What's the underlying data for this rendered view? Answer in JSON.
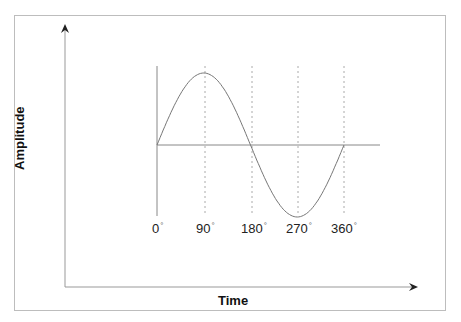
{
  "diagram": {
    "x_axis_label": "Time",
    "y_axis_label": "Amplitude",
    "tick_labels": [
      {
        "value": "0",
        "unit": "°",
        "x": 152
      },
      {
        "value": "90",
        "unit": "°",
        "x": 196
      },
      {
        "value": "180",
        "unit": "°",
        "x": 241
      },
      {
        "value": "270",
        "unit": "°",
        "x": 286
      },
      {
        "value": "360",
        "unit": "°",
        "x": 331
      }
    ]
  },
  "chart_data": {
    "type": "line",
    "title": "",
    "xlabel": "Time",
    "ylabel": "Amplitude",
    "categories": [
      "0°",
      "90°",
      "180°",
      "270°",
      "360°"
    ],
    "x": [
      0,
      90,
      180,
      270,
      360
    ],
    "series": [
      {
        "name": "sin",
        "values": [
          0,
          1,
          0,
          -1,
          0
        ]
      }
    ],
    "grid": "dashed vertical lines at 90°, 180°, 270°, 360°"
  }
}
